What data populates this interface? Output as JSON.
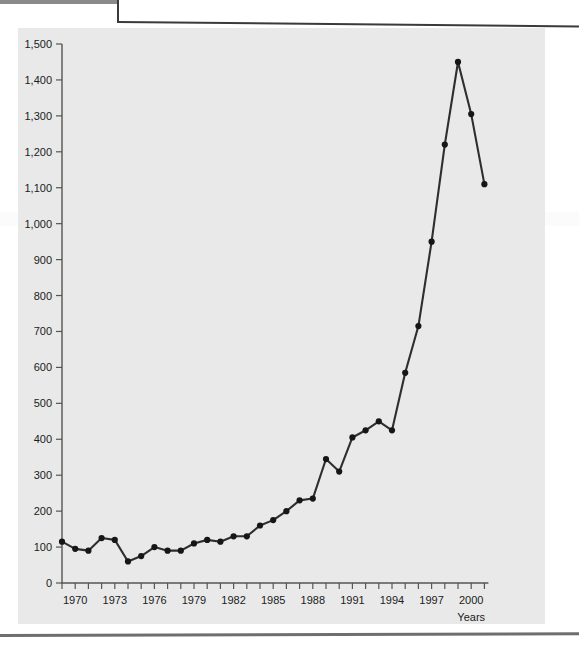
{
  "page": {
    "background_color": "#ffffff",
    "plot_background_color": "#e9e9e9",
    "line_color": "#2e2e2e",
    "marker_color": "#161616",
    "axis_color": "#555555",
    "text_color": "#1b1b1b"
  },
  "chart_data": {
    "type": "line",
    "title": "",
    "xlabel": "Years",
    "ylabel": "",
    "xlim": [
      1968.5,
      2001.5
    ],
    "ylim": [
      0,
      1500
    ],
    "grid": false,
    "legend": null,
    "y_ticks": [
      0,
      100,
      200,
      300,
      400,
      500,
      600,
      700,
      800,
      900,
      1000,
      1100,
      1200,
      1300,
      1400,
      1500
    ],
    "y_tick_labels": [
      "0",
      "100",
      "200",
      "300",
      "400",
      "500",
      "600",
      "700",
      "800",
      "900",
      "1,000",
      "1,100",
      "1,200",
      "1,300",
      "1,400",
      "1,500"
    ],
    "x_ticks": [
      1969,
      1970,
      1971,
      1972,
      1973,
      1974,
      1975,
      1976,
      1977,
      1978,
      1979,
      1980,
      1981,
      1982,
      1983,
      1984,
      1985,
      1986,
      1987,
      1988,
      1989,
      1990,
      1991,
      1992,
      1993,
      1994,
      1995,
      1996,
      1997,
      1998,
      1999,
      2000,
      2001
    ],
    "x_tick_labels": [
      "1970",
      "1973",
      "1976",
      "1979",
      "1982",
      "1985",
      "1988",
      "1991",
      "1994",
      "1997",
      "2000"
    ],
    "x_tick_label_values": [
      1970,
      1973,
      1976,
      1979,
      1982,
      1985,
      1988,
      1991,
      1994,
      1997,
      2000
    ],
    "x": [
      1969,
      1970,
      1971,
      1972,
      1973,
      1974,
      1975,
      1976,
      1977,
      1978,
      1979,
      1980,
      1981,
      1982,
      1983,
      1984,
      1985,
      1986,
      1987,
      1988,
      1989,
      1990,
      1991,
      1992,
      1993,
      1994,
      1995,
      1996,
      1997,
      1998,
      1999,
      2000,
      2001
    ],
    "values": [
      115,
      95,
      90,
      125,
      120,
      60,
      75,
      100,
      90,
      90,
      110,
      120,
      115,
      130,
      130,
      160,
      175,
      200,
      230,
      235,
      345,
      310,
      405,
      425,
      450,
      425,
      585,
      715,
      950,
      1220,
      1450,
      1305,
      1110
    ],
    "marker": "circle",
    "series_name": ""
  }
}
